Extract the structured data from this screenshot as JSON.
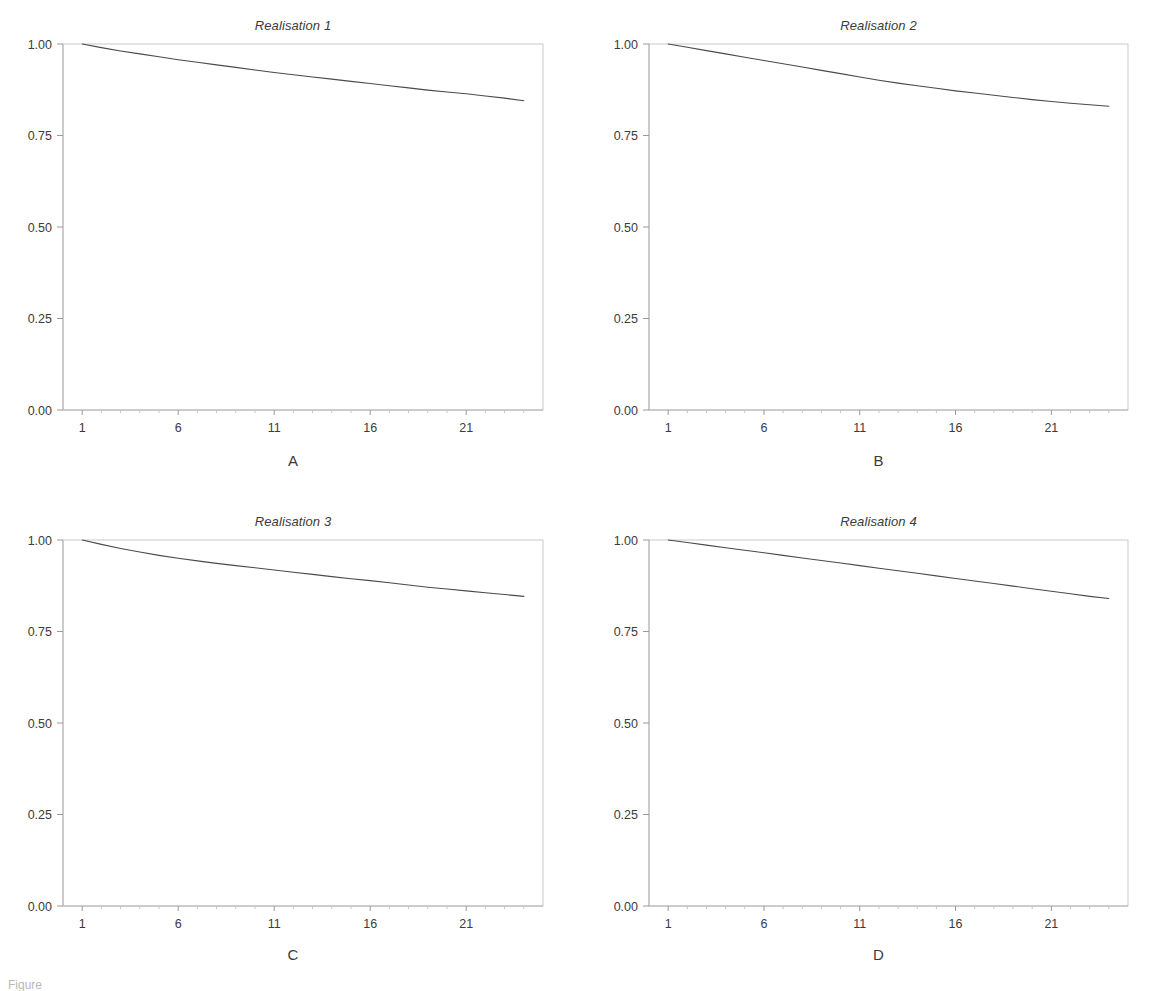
{
  "figure": {
    "caption_fragment": "Figure",
    "panel_count": 4,
    "layout": "2x2 grid"
  },
  "axis": {
    "y_ticks": [
      "0.00",
      "0.25",
      "0.50",
      "0.75",
      "1.00"
    ],
    "x_ticks": [
      "1",
      "6",
      "11",
      "16",
      "21"
    ]
  },
  "panels": [
    {
      "letter": "A",
      "title": "Realisation 1"
    },
    {
      "letter": "B",
      "title": "Realisation 2"
    },
    {
      "letter": "C",
      "title": "Realisation 3"
    },
    {
      "letter": "D",
      "title": "Realisation 4"
    }
  ],
  "chart_data": [
    {
      "type": "line",
      "title": "Realisation 1",
      "panel_letter": "A",
      "xlabel": "",
      "ylabel": "",
      "xlim": [
        0,
        25
      ],
      "ylim": [
        0.0,
        1.0
      ],
      "grid": false,
      "legend": "none",
      "xtick_labels": [
        "1",
        "6",
        "11",
        "16",
        "21"
      ],
      "xtick_values": [
        1,
        6,
        11,
        16,
        21
      ],
      "ytick_labels": [
        "0.00",
        "0.25",
        "0.50",
        "0.75",
        "1.00"
      ],
      "ytick_values": [
        0.0,
        0.25,
        0.5,
        0.75,
        1.0
      ],
      "x": [
        1,
        2,
        3,
        4,
        5,
        6,
        7,
        8,
        9,
        10,
        11,
        12,
        13,
        14,
        15,
        16,
        17,
        18,
        19,
        20,
        21,
        22,
        23,
        24
      ],
      "values": [
        1.0,
        0.99,
        0.981,
        0.973,
        0.965,
        0.957,
        0.95,
        0.943,
        0.936,
        0.929,
        0.922,
        0.916,
        0.91,
        0.904,
        0.898,
        0.892,
        0.886,
        0.88,
        0.874,
        0.869,
        0.864,
        0.858,
        0.852,
        0.845
      ]
    },
    {
      "type": "line",
      "title": "Realisation 2",
      "panel_letter": "B",
      "xlabel": "",
      "ylabel": "",
      "xlim": [
        0,
        25
      ],
      "ylim": [
        0.0,
        1.0
      ],
      "grid": false,
      "legend": "none",
      "xtick_labels": [
        "1",
        "6",
        "11",
        "16",
        "21"
      ],
      "xtick_values": [
        1,
        6,
        11,
        16,
        21
      ],
      "ytick_labels": [
        "0.00",
        "0.25",
        "0.50",
        "0.75",
        "1.00"
      ],
      "ytick_values": [
        0.0,
        0.25,
        0.5,
        0.75,
        1.0
      ],
      "x": [
        1,
        2,
        3,
        4,
        5,
        6,
        7,
        8,
        9,
        10,
        11,
        12,
        13,
        14,
        15,
        16,
        17,
        18,
        19,
        20,
        21,
        22,
        23,
        24
      ],
      "values": [
        1.0,
        0.991,
        0.982,
        0.973,
        0.964,
        0.955,
        0.946,
        0.937,
        0.928,
        0.919,
        0.91,
        0.901,
        0.893,
        0.886,
        0.879,
        0.872,
        0.866,
        0.86,
        0.854,
        0.848,
        0.843,
        0.838,
        0.834,
        0.83
      ]
    },
    {
      "type": "line",
      "title": "Realisation 3",
      "panel_letter": "C",
      "xlabel": "",
      "ylabel": "",
      "xlim": [
        0,
        25
      ],
      "ylim": [
        0.0,
        1.0
      ],
      "grid": false,
      "legend": "none",
      "xtick_labels": [
        "1",
        "6",
        "11",
        "16",
        "21"
      ],
      "xtick_values": [
        1,
        6,
        11,
        16,
        21
      ],
      "ytick_labels": [
        "0.00",
        "0.25",
        "0.50",
        "0.75",
        "1.00"
      ],
      "ytick_values": [
        0.0,
        0.25,
        0.5,
        0.75,
        1.0
      ],
      "x": [
        1,
        2,
        3,
        4,
        5,
        6,
        7,
        8,
        9,
        10,
        11,
        12,
        13,
        14,
        15,
        16,
        17,
        18,
        19,
        20,
        21,
        22,
        23,
        24
      ],
      "values": [
        1.0,
        0.988,
        0.977,
        0.967,
        0.958,
        0.95,
        0.943,
        0.936,
        0.93,
        0.924,
        0.918,
        0.912,
        0.906,
        0.9,
        0.894,
        0.889,
        0.883,
        0.877,
        0.871,
        0.866,
        0.861,
        0.856,
        0.851,
        0.846
      ]
    },
    {
      "type": "line",
      "title": "Realisation 4",
      "panel_letter": "D",
      "xlabel": "",
      "ylabel": "",
      "xlim": [
        0,
        25
      ],
      "ylim": [
        0.0,
        1.0
      ],
      "grid": false,
      "legend": "none",
      "xtick_labels": [
        "1",
        "6",
        "11",
        "16",
        "21"
      ],
      "xtick_values": [
        1,
        6,
        11,
        16,
        21
      ],
      "ytick_labels": [
        "0.00",
        "0.25",
        "0.50",
        "0.75",
        "1.00"
      ],
      "ytick_values": [
        0.0,
        0.25,
        0.5,
        0.75,
        1.0
      ],
      "x": [
        1,
        2,
        3,
        4,
        5,
        6,
        7,
        8,
        9,
        10,
        11,
        12,
        13,
        14,
        15,
        16,
        17,
        18,
        19,
        20,
        21,
        22,
        23,
        24
      ],
      "values": [
        1.0,
        0.993,
        0.986,
        0.979,
        0.972,
        0.965,
        0.958,
        0.951,
        0.944,
        0.937,
        0.93,
        0.923,
        0.916,
        0.909,
        0.902,
        0.895,
        0.888,
        0.881,
        0.874,
        0.867,
        0.86,
        0.853,
        0.846,
        0.84
      ]
    }
  ],
  "colors": {
    "curve": "#4a4a4a",
    "frame": "#c9c9c9",
    "text": "#3b3b3b",
    "background": "#ffffff"
  }
}
